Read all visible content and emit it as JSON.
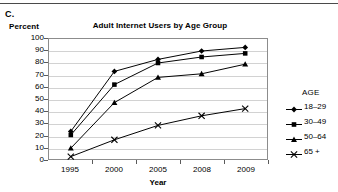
{
  "panel": {
    "letter": "C."
  },
  "labels": {
    "y_axis_title": "Percent",
    "x_axis_title": "Year",
    "chart_title": "Adult Internet Users by Age Group"
  },
  "legend": {
    "title": "AGE",
    "entries": [
      {
        "label": "18–29",
        "marker": "diamond-marker"
      },
      {
        "label": "30–49",
        "marker": "square-marker"
      },
      {
        "label": "50–64",
        "marker": "triangle-marker"
      },
      {
        "label": "65 +",
        "marker": "x-marker"
      }
    ]
  },
  "chart_data": {
    "type": "line",
    "title": "Adult Internet Users by Age Group",
    "xlabel": "Year",
    "ylabel": "Percent",
    "categories": [
      "1995",
      "2000",
      "2005",
      "2008",
      "2009"
    ],
    "ylim": [
      0,
      100
    ],
    "yticks": [
      0,
      10,
      20,
      30,
      40,
      50,
      60,
      70,
      80,
      90,
      100
    ],
    "grid": "horizontal",
    "legend_position": "right",
    "series": [
      {
        "name": "18–29",
        "marker": "diamond",
        "values": [
          23,
          73,
          83,
          90,
          93
        ]
      },
      {
        "name": "30–49",
        "marker": "square",
        "values": [
          20,
          62,
          80,
          85,
          88
        ]
      },
      {
        "name": "50–64",
        "marker": "triangle",
        "values": [
          9,
          47,
          68,
          71,
          79
        ]
      },
      {
        "name": "65 +",
        "marker": "x",
        "values": [
          2,
          16,
          28,
          36,
          42
        ]
      }
    ],
    "color": "#000000"
  }
}
